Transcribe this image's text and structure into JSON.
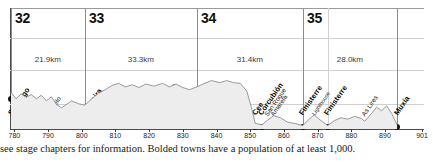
{
  "chart_data": {
    "type": "area",
    "title": "",
    "xlabel": "",
    "ylabel": "",
    "xlim": [
      779,
      901
    ],
    "ylim": [
      0,
      420
    ],
    "grid": true,
    "legend": null,
    "axis_ticks": [
      {
        "value": 780,
        "label": "780"
      },
      {
        "value": 790,
        "label": "790"
      },
      {
        "value": 800,
        "label": "800"
      },
      {
        "value": 810,
        "label": "810"
      },
      {
        "value": 820,
        "label": "820"
      },
      {
        "value": 830,
        "label": "830"
      },
      {
        "value": 840,
        "label": "840"
      },
      {
        "value": 850,
        "label": "850"
      },
      {
        "value": 860,
        "label": "860"
      },
      {
        "value": 870,
        "label": "870"
      },
      {
        "value": 880,
        "label": "880"
      },
      {
        "value": 890,
        "label": "890"
      },
      {
        "value": 901,
        "label": "901"
      }
    ],
    "stages": [
      {
        "number": "32",
        "distance": "21.9km",
        "start_km": 779.0,
        "end_km": 800.9
      },
      {
        "number": "33",
        "distance": "33.3km",
        "start_km": 800.9,
        "end_km": 834.2
      },
      {
        "number": "34",
        "distance": "31.4km",
        "start_km": 834.2,
        "end_km": 865.6
      },
      {
        "number": "35",
        "distance": "28.0km",
        "start_km": 865.6,
        "end_km": 893.6
      }
    ],
    "towns": [
      {
        "name": "Santiago",
        "km": 779.0,
        "bold": true,
        "size": "normal"
      },
      {
        "name": "Castelo",
        "km": 790.0,
        "bold": false,
        "size": "normal"
      },
      {
        "name": "Negreira",
        "km": 800.9,
        "bold": true,
        "size": "normal"
      },
      {
        "name": "Vilaserio",
        "km": 813.0,
        "bold": false,
        "size": "normal"
      },
      {
        "name": "Santa Mariña",
        "km": 821.5,
        "bold": false,
        "size": "normal"
      },
      {
        "name": "Ponte Olveira",
        "km": 832.0,
        "bold": false,
        "size": "normal"
      },
      {
        "name": "Olveiroa",
        "km": 834.2,
        "bold": false,
        "size": "normal"
      },
      {
        "name": "Logoso",
        "km": 837.0,
        "bold": false,
        "size": "normal"
      },
      {
        "name": "Hospital",
        "km": 838.5,
        "bold": false,
        "size": "normal"
      },
      {
        "name": "Cee",
        "km": 851.5,
        "bold": true,
        "size": "normal"
      },
      {
        "name": "Corcubión",
        "km": 853.5,
        "bold": true,
        "size": "normal"
      },
      {
        "name": "San Roque",
        "km": 855.0,
        "bold": false,
        "size": "normal"
      },
      {
        "name": "Amarela",
        "km": 857.0,
        "bold": false,
        "size": "normal"
      },
      {
        "name": "Finisterre",
        "km": 865.6,
        "bold": true,
        "size": "normal"
      },
      {
        "name": "Lighthouse",
        "km": 869.0,
        "bold": false,
        "size": "small"
      },
      {
        "name": "Finisterre",
        "km": 873.0,
        "bold": true,
        "size": "normal"
      },
      {
        "name": "As Lires",
        "km": 884.0,
        "bold": false,
        "size": "normal"
      },
      {
        "name": "Muxía",
        "km": 893.6,
        "bold": true,
        "size": "normal"
      }
    ],
    "elevation_profile": [
      {
        "km": 779.0,
        "m": 260
      },
      {
        "km": 780.5,
        "m": 215
      },
      {
        "km": 782.0,
        "m": 250
      },
      {
        "km": 783.5,
        "m": 225
      },
      {
        "km": 785.0,
        "m": 245
      },
      {
        "km": 786.5,
        "m": 215
      },
      {
        "km": 788.0,
        "m": 240
      },
      {
        "km": 789.5,
        "m": 200
      },
      {
        "km": 791.0,
        "m": 230
      },
      {
        "km": 792.5,
        "m": 175
      },
      {
        "km": 794.0,
        "m": 150
      },
      {
        "km": 795.5,
        "m": 175
      },
      {
        "km": 797.0,
        "m": 200
      },
      {
        "km": 799.0,
        "m": 180
      },
      {
        "km": 800.9,
        "m": 170
      },
      {
        "km": 803.0,
        "m": 215
      },
      {
        "km": 805.0,
        "m": 255
      },
      {
        "km": 807.0,
        "m": 280
      },
      {
        "km": 809.0,
        "m": 310
      },
      {
        "km": 811.0,
        "m": 325
      },
      {
        "km": 813.0,
        "m": 300
      },
      {
        "km": 815.0,
        "m": 315
      },
      {
        "km": 817.0,
        "m": 295
      },
      {
        "km": 819.0,
        "m": 320
      },
      {
        "km": 821.5,
        "m": 305
      },
      {
        "km": 824.0,
        "m": 325
      },
      {
        "km": 826.0,
        "m": 300
      },
      {
        "km": 828.0,
        "m": 320
      },
      {
        "km": 830.0,
        "m": 295
      },
      {
        "km": 832.0,
        "m": 280
      },
      {
        "km": 834.2,
        "m": 300
      },
      {
        "km": 836.0,
        "m": 320
      },
      {
        "km": 838.5,
        "m": 345
      },
      {
        "km": 841.0,
        "m": 330
      },
      {
        "km": 843.0,
        "m": 345
      },
      {
        "km": 845.0,
        "m": 330
      },
      {
        "km": 847.0,
        "m": 325
      },
      {
        "km": 849.0,
        "m": 270
      },
      {
        "km": 850.5,
        "m": 140
      },
      {
        "km": 851.5,
        "m": 40
      },
      {
        "km": 853.5,
        "m": 30
      },
      {
        "km": 855.0,
        "m": 60
      },
      {
        "km": 857.0,
        "m": 95
      },
      {
        "km": 859.0,
        "m": 80
      },
      {
        "km": 861.0,
        "m": 50
      },
      {
        "km": 863.0,
        "m": 40
      },
      {
        "km": 865.6,
        "m": 25
      },
      {
        "km": 867.5,
        "m": 70
      },
      {
        "km": 869.0,
        "m": 100
      },
      {
        "km": 871.0,
        "m": 60
      },
      {
        "km": 873.0,
        "m": 25
      },
      {
        "km": 875.0,
        "m": 60
      },
      {
        "km": 877.0,
        "m": 80
      },
      {
        "km": 879.0,
        "m": 70
      },
      {
        "km": 881.0,
        "m": 90
      },
      {
        "km": 883.0,
        "m": 75
      },
      {
        "km": 884.0,
        "m": 55
      },
      {
        "km": 886.0,
        "m": 110
      },
      {
        "km": 887.5,
        "m": 155
      },
      {
        "km": 889.0,
        "m": 130
      },
      {
        "km": 890.5,
        "m": 165
      },
      {
        "km": 892.0,
        "m": 110
      },
      {
        "km": 893.6,
        "m": 30
      }
    ]
  },
  "caption": {
    "text": "see stage chapters for information. Bolded towns have a population of at least 1,000."
  }
}
